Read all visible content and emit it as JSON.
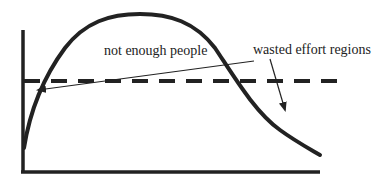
{
  "diagram": {
    "labels": {
      "not_enough_people": "not enough people",
      "wasted_effort_regions": "wasted effort regions"
    },
    "colors": {
      "ink": "#222222",
      "background": "#ffffff"
    },
    "elements": {
      "y_axis": {
        "x": 23,
        "y_top": 30,
        "y_bottom": 172
      },
      "x_axis": {
        "y": 172,
        "x_left": 23,
        "x_right": 320
      },
      "threshold_line": {
        "style": "dashed",
        "y": 81,
        "x_left": 23,
        "x_right": 348
      },
      "curve": {
        "shape": "rise-then-fall",
        "start": [
          23,
          148
        ],
        "peak": [
          140,
          14
        ],
        "end": [
          320,
          155
        ]
      },
      "arrows": [
        {
          "from_label": "not enough people",
          "from": [
            254,
            61
          ],
          "to": [
            37,
            90
          ]
        },
        {
          "from_label": "wasted effort regions",
          "from": [
            270,
            58
          ],
          "to": [
            285,
            110
          ]
        }
      ]
    }
  }
}
